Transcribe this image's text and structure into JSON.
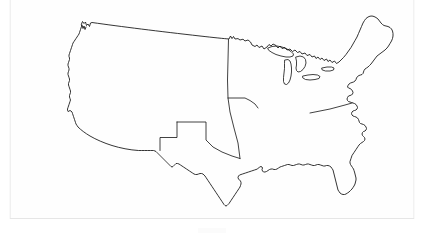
{
  "document": {
    "type": "scanned-page",
    "title": "Blank United States Outline Map",
    "page_background": "#ffffff",
    "paper_color": "#fefefe",
    "ink_color": "#111111",
    "visible_text": "",
    "page_number": ""
  },
  "map": {
    "name": "united-states-outline-map",
    "projection_style": "mercator-conic",
    "line_color": "#111111",
    "line_width_px": 0.85,
    "fill": "none",
    "coverage": "contiguous-48-states",
    "includes_alaska": false,
    "includes_hawaii": false,
    "features": [
      {
        "name": "national-outline",
        "label": "Contiguous United States coastline and borders"
      },
      {
        "name": "canada-border-north",
        "label": "Northern border with Canada (49th parallel)"
      },
      {
        "name": "pacific-coast",
        "label": "Pacific coastline"
      },
      {
        "name": "atlantic-coast",
        "label": "Atlantic coastline"
      },
      {
        "name": "gulf-coast",
        "label": "Gulf of Mexico coastline"
      },
      {
        "name": "mexico-border",
        "label": "Southern border with Mexico"
      },
      {
        "name": "great-lakes",
        "label": "Great Lakes"
      },
      {
        "name": "puget-sound",
        "label": "Puget Sound"
      },
      {
        "name": "san-francisco-bay",
        "label": "San Francisco Bay"
      },
      {
        "name": "chesapeake-bay",
        "label": "Chesapeake Bay and Delmarva Peninsula"
      },
      {
        "name": "florida-peninsula",
        "label": "Florida Peninsula"
      },
      {
        "name": "cape-cod",
        "label": "Cape Cod"
      },
      {
        "name": "long-island",
        "label": "Long Island"
      },
      {
        "name": "mississippi-delta",
        "label": "Mississippi River Delta"
      },
      {
        "name": "lake-of-the-woods",
        "label": "Lake of the Woods notch"
      }
    ],
    "internal_borders": [
      {
        "name": "state-border-texas",
        "label": "Texas state boundary"
      },
      {
        "name": "state-border-plains-vertical",
        "label": "North-south Plains states boundary"
      },
      {
        "name": "state-border-kansas-missouri",
        "label": "Kansas and Missouri boundary"
      },
      {
        "name": "state-border-virginia-north-carolina",
        "label": "Virginia and North Carolina boundary"
      }
    ],
    "labels": [],
    "legend": null,
    "scale_bar": null,
    "compass_rose": null
  }
}
